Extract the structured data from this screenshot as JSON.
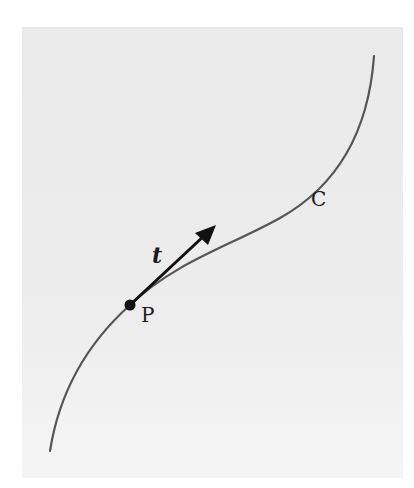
{
  "figure": {
    "labels": {
      "tangent": "t",
      "point": "P",
      "curve": "C"
    },
    "colors": {
      "background": "#ffffff",
      "panel": "#ebebeb",
      "curve": "#555555",
      "vector": "#111111",
      "point": "#111111"
    },
    "elements": {
      "curve_C": {
        "path": "M50,451 C58,400 80,350 130,305 C175,262 230,246 280,218 C330,190 368,140 374,56"
      },
      "point_P": {
        "cx": 130,
        "cy": 305,
        "r": 5
      },
      "tangent_vector_t": {
        "x1": 130,
        "y1": 305,
        "x2": 215,
        "y2": 227
      }
    }
  }
}
